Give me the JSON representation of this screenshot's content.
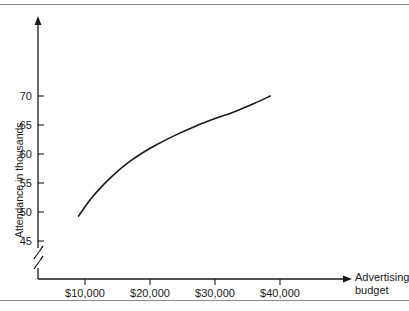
{
  "chart_data": {
    "type": "line",
    "title": "",
    "xlabel": "Advertising budget",
    "ylabel": "Attendance in thousands",
    "xtick_labels": [
      "$10,000",
      "$20,000",
      "$30,000",
      "$40,000"
    ],
    "xtick_values": [
      10000,
      20000,
      30000,
      40000
    ],
    "ytick_labels": [
      "45",
      "50",
      "55",
      "60",
      "65",
      "70"
    ],
    "ytick_values": [
      45,
      50,
      55,
      60,
      65,
      70
    ],
    "xlim": [
      0,
      48000
    ],
    "ylim": [
      43,
      78
    ],
    "grid": false,
    "legend": null,
    "y_axis_break": true,
    "y_axis_break_label": "axis-break-zigzag",
    "series": [
      {
        "name": "Attendance vs advertising budget",
        "x": [
          9000,
          11000,
          13000,
          15000,
          17000,
          19000,
          21000,
          24000,
          27000,
          30000,
          33000,
          36000,
          38500
        ],
        "y": [
          49.3,
          52.4,
          54.9,
          57.0,
          58.8,
          60.3,
          61.6,
          63.3,
          64.8,
          66.1,
          67.3,
          68.7,
          70.0
        ]
      }
    ],
    "annotations": {
      "curve_shape": "concave-down increasing (logarithmic)",
      "start_point": {
        "x": "$9,000",
        "y": 49.3
      },
      "end_point": {
        "x": "$38,500",
        "y": 70.0
      }
    }
  },
  "axes": {
    "y_title": "Attendance in thousands",
    "x_title_line1": "Advertising",
    "x_title_line2": "budget"
  }
}
